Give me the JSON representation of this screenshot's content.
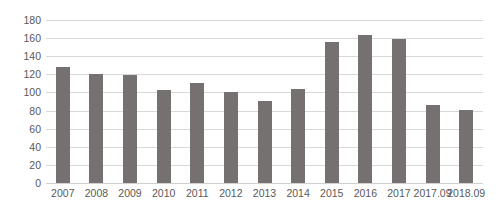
{
  "chart_data": {
    "type": "bar",
    "title": "",
    "xlabel": "",
    "ylabel": "",
    "ylim": [
      0,
      180
    ],
    "yticks": [
      0,
      20,
      40,
      60,
      80,
      100,
      120,
      140,
      160,
      180
    ],
    "grid": true,
    "legend": "none",
    "bar_color": "#767171",
    "gridline_color": "#d9d9d9",
    "tick_label_color": "#595959",
    "categories": [
      "2007",
      "2008",
      "2009",
      "2010",
      "2011",
      "2012",
      "2013",
      "2014",
      "2015",
      "2016",
      "2017",
      "2017.09",
      "2018.09"
    ],
    "values": [
      128,
      120,
      119,
      103,
      110,
      100,
      91,
      104,
      156,
      163,
      159,
      86,
      81
    ],
    "series": [
      {
        "name": "",
        "values": [
          128,
          120,
          119,
          103,
          110,
          100,
          91,
          104,
          156,
          163,
          159,
          86,
          81
        ]
      }
    ]
  }
}
